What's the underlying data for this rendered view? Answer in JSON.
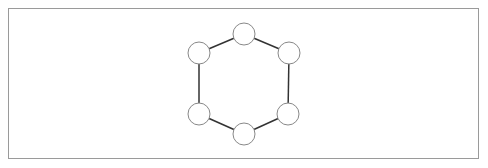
{
  "diagram": {
    "type": "graph",
    "title": "",
    "colors": {
      "frame": "#9a9a9a",
      "edge": "#333333",
      "node_stroke": "#888888",
      "node_fill": "#ffffff"
    },
    "node_radius": 11,
    "nodes": [
      {
        "id": "n1",
        "label": "",
        "x": 244,
        "y": 34
      },
      {
        "id": "n2",
        "label": "",
        "x": 289,
        "y": 53
      },
      {
        "id": "n3",
        "label": "",
        "x": 288,
        "y": 114
      },
      {
        "id": "n4",
        "label": "",
        "x": 244,
        "y": 134
      },
      {
        "id": "n5",
        "label": "",
        "x": 199,
        "y": 114
      },
      {
        "id": "n6",
        "label": "",
        "x": 199,
        "y": 53
      }
    ],
    "edges": [
      {
        "from": "n1",
        "to": "n2"
      },
      {
        "from": "n2",
        "to": "n3"
      },
      {
        "from": "n3",
        "to": "n4"
      },
      {
        "from": "n4",
        "to": "n5"
      },
      {
        "from": "n5",
        "to": "n6"
      },
      {
        "from": "n6",
        "to": "n1"
      }
    ]
  }
}
